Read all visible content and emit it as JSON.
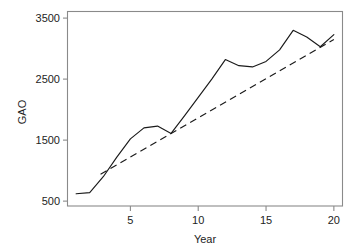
{
  "chart_data": {
    "type": "line",
    "title": "",
    "xlabel": "Year",
    "ylabel": "GAO",
    "xlim": [
      0.4,
      20.6
    ],
    "ylim": [
      420,
      3600
    ],
    "grid": false,
    "legend": null,
    "xticks": [
      5,
      10,
      15,
      20
    ],
    "xtick_labels": [
      "5",
      "10",
      "15",
      "20"
    ],
    "yticks": [
      500,
      1500,
      2500,
      3500
    ],
    "ytick_labels": [
      "500",
      "1500",
      "2500",
      "3500"
    ],
    "x": [
      1,
      2,
      3,
      4,
      5,
      6,
      7,
      8,
      9,
      10,
      11,
      12,
      13,
      14,
      15,
      16,
      17,
      18,
      19,
      20
    ],
    "series": [
      {
        "name": "GAO observed",
        "style": "solid",
        "color": "#1a1a1a",
        "values": [
          620,
          640,
          900,
          1220,
          1520,
          1700,
          1730,
          1610,
          1900,
          2200,
          2500,
          2820,
          2720,
          2700,
          2790,
          2980,
          3300,
          3190,
          3030,
          3230
        ]
      },
      {
        "name": "GAO trend",
        "style": "dashed",
        "color": "#1a1a1a",
        "x": [
          2.8,
          20
        ],
        "values": [
          940,
          3150
        ]
      }
    ],
    "annotations": []
  },
  "axes": {
    "y_axis_title": "GAO",
    "x_axis_title": "Year"
  }
}
